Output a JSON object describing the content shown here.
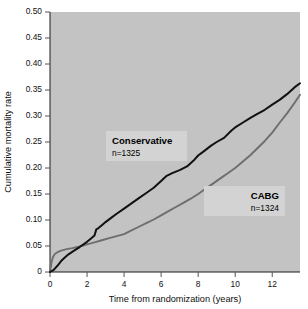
{
  "chart_data": {
    "type": "line",
    "title": "",
    "xlabel": "Time from randomization (years)",
    "ylabel": "Cumulative mortality rate",
    "xlim": [
      0,
      13.5
    ],
    "ylim": [
      0,
      0.5
    ],
    "grid": false,
    "legend_position": "inline-annotations",
    "xticks": [
      "0",
      "2",
      "4",
      "6",
      "8",
      "10",
      "12"
    ],
    "xtick_values": [
      0,
      2,
      4,
      6,
      8,
      10,
      12
    ],
    "yticks": [
      "0",
      "0.05",
      "0.10",
      "0.15",
      "0.20",
      "0.25",
      "0.30",
      "0.35",
      "0.40",
      "0.45",
      "0.50"
    ],
    "ytick_values": [
      0,
      0.05,
      0.1,
      0.15,
      0.2,
      0.25,
      0.3,
      0.35,
      0.4,
      0.45,
      0.5
    ],
    "series": [
      {
        "name": "Conservative",
        "n_label": "n=1325",
        "color": "#111111",
        "x": [
          0,
          0.2,
          0.4,
          0.6,
          0.8,
          1.0,
          1.3,
          1.6,
          2.0,
          2.2,
          2.4,
          2.5,
          2.6,
          2.8,
          3.0,
          3.3,
          3.6,
          4.0,
          4.4,
          4.8,
          5.2,
          5.6,
          6.0,
          6.3,
          6.6,
          7.0,
          7.4,
          7.8,
          8.0,
          8.3,
          8.7,
          9.0,
          9.4,
          9.8,
          10.0,
          10.4,
          10.8,
          11.2,
          11.6,
          12.0,
          12.4,
          12.8,
          13.2,
          13.5
        ],
        "y": [
          0.0,
          0.004,
          0.012,
          0.021,
          0.028,
          0.034,
          0.041,
          0.048,
          0.058,
          0.064,
          0.07,
          0.082,
          0.084,
          0.09,
          0.096,
          0.104,
          0.112,
          0.122,
          0.132,
          0.142,
          0.152,
          0.162,
          0.175,
          0.185,
          0.19,
          0.196,
          0.203,
          0.216,
          0.224,
          0.232,
          0.243,
          0.25,
          0.258,
          0.272,
          0.278,
          0.287,
          0.296,
          0.304,
          0.312,
          0.322,
          0.331,
          0.342,
          0.355,
          0.363
        ]
      },
      {
        "name": "CABG",
        "n_label": "n=1324",
        "color": "#6e6e6e",
        "x": [
          0,
          0.08,
          0.15,
          0.25,
          0.4,
          0.6,
          0.9,
          1.2,
          1.6,
          2.0,
          2.4,
          2.8,
          3.2,
          3.6,
          4.0,
          4.4,
          4.8,
          5.2,
          5.6,
          6.0,
          6.4,
          6.8,
          7.2,
          7.6,
          8.0,
          8.4,
          8.8,
          9.2,
          9.6,
          10.0,
          10.4,
          10.8,
          11.2,
          11.6,
          12.0,
          12.4,
          12.8,
          13.2,
          13.5
        ],
        "y": [
          0.0,
          0.018,
          0.028,
          0.034,
          0.038,
          0.041,
          0.044,
          0.046,
          0.049,
          0.053,
          0.057,
          0.061,
          0.065,
          0.069,
          0.073,
          0.08,
          0.087,
          0.094,
          0.101,
          0.109,
          0.117,
          0.125,
          0.133,
          0.141,
          0.15,
          0.16,
          0.17,
          0.18,
          0.19,
          0.2,
          0.212,
          0.224,
          0.238,
          0.252,
          0.268,
          0.287,
          0.305,
          0.325,
          0.341
        ]
      }
    ],
    "annotations": [
      {
        "label": "Conservative",
        "sub": "n=1325",
        "align": "left"
      },
      {
        "label": "CABG",
        "sub": "n=1324",
        "align": "right"
      }
    ]
  }
}
